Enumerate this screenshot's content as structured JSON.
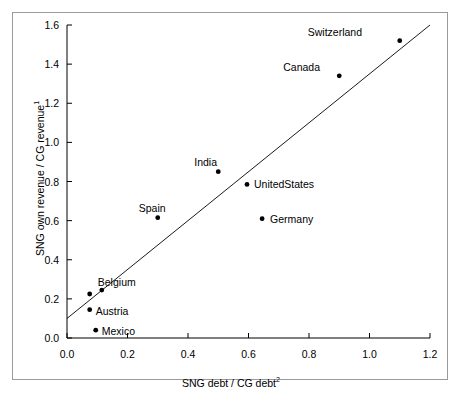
{
  "chart_data": {
    "type": "scatter",
    "title": "",
    "xlabel": "SNG debt / CG debt2",
    "xlabel_main": "SNG debt / CG debt",
    "xlabel_sup": "2",
    "ylabel": "SNG own revenue / CG revenue1",
    "ylabel_main": "SNG own revenue / CG revenue",
    "ylabel_sup": "1",
    "xlim": [
      0.0,
      1.2
    ],
    "ylim": [
      0.0,
      1.6
    ],
    "xticks": [
      "0.0",
      "0.2",
      "0.4",
      "0.6",
      "0.8",
      "1.0",
      "1.2"
    ],
    "xtick_values": [
      0.0,
      0.2,
      0.4,
      0.6,
      0.8,
      1.0,
      1.2
    ],
    "yticks": [
      "0.0",
      "0.2",
      "0.4",
      "0.6",
      "0.8",
      "1.0",
      "1.2",
      "1.4",
      "1.6"
    ],
    "ytick_values": [
      0.0,
      0.2,
      0.4,
      0.6,
      0.8,
      1.0,
      1.2,
      1.4,
      1.6
    ],
    "grid": false,
    "legend": "none",
    "marker_color": "#000000",
    "line_color": "#000000",
    "axis_color": "#000000",
    "points": [
      {
        "name": "Switzerland",
        "x": 1.1,
        "y": 1.52,
        "label_dx": -92,
        "label_dy": -14
      },
      {
        "name": "Canada",
        "x": 0.9,
        "y": 1.34,
        "label_dx": -56,
        "label_dy": -14
      },
      {
        "name": "India",
        "x": 0.5,
        "y": 0.85,
        "label_dx": -24,
        "label_dy": -15
      },
      {
        "name": "UnitedStates",
        "x": 0.595,
        "y": 0.785,
        "label_dx": 7,
        "label_dy": -5
      },
      {
        "name": "Germany",
        "x": 0.645,
        "y": 0.61,
        "label_dx": 8,
        "label_dy": -5
      },
      {
        "name": "Spain",
        "x": 0.3,
        "y": 0.615,
        "label_dx": -19,
        "label_dy": -15
      },
      {
        "name": "Belgium",
        "x": 0.115,
        "y": 0.245,
        "label_dx": -4,
        "label_dy": -13
      },
      {
        "name": "Austria",
        "x": 0.075,
        "y": 0.145,
        "label_dx": 6,
        "label_dy": -4
      },
      {
        "name": "Mexico",
        "x": 0.095,
        "y": 0.04,
        "label_dx": 6,
        "label_dy": -4
      }
    ],
    "unlabeled_points": [
      {
        "x": 0.075,
        "y": 0.225
      }
    ],
    "reference_line": {
      "name": "45-degree reference line",
      "x_start": 0.0,
      "y_start": 0.1,
      "x_end": 1.2,
      "y_end": 1.6
    }
  }
}
